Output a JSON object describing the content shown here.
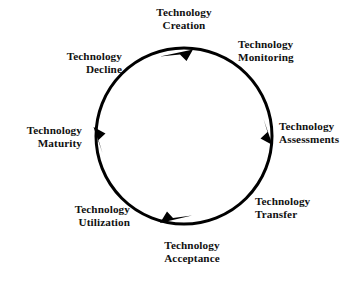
{
  "diagram": {
    "type": "cycle",
    "direction": "clockwise",
    "background_color": "#ffffff",
    "stroke_color": "#000000",
    "text_color": "#111111",
    "circle": {
      "cx": 184,
      "cy": 136,
      "r": 88,
      "stroke_width": 3
    },
    "stages": [
      {
        "id": "creation",
        "line1": "Technology",
        "line2": "Creation",
        "angle_deg": 270,
        "align": "center"
      },
      {
        "id": "monitoring",
        "line1": "Technology",
        "line2": "Monitoring",
        "angle_deg": 315,
        "align": "left"
      },
      {
        "id": "assessments",
        "line1": "Technology",
        "line2": "Assessments",
        "angle_deg": 0,
        "align": "left"
      },
      {
        "id": "transfer",
        "line1": "Technology",
        "line2": "Transfer",
        "angle_deg": 45,
        "align": "left"
      },
      {
        "id": "acceptance",
        "line1": "Technology",
        "line2": "Acceptance",
        "angle_deg": 90,
        "align": "center"
      },
      {
        "id": "utilization",
        "line1": "Technology",
        "line2": "Utilization",
        "angle_deg": 135,
        "align": "right"
      },
      {
        "id": "maturity",
        "line1": "Technology",
        "line2": "Maturity",
        "angle_deg": 180,
        "align": "right"
      },
      {
        "id": "decline",
        "line1": "Technology",
        "line2": "Decline",
        "angle_deg": 225,
        "align": "right"
      }
    ],
    "arrowheads": [
      {
        "id": "top",
        "position": "top",
        "points_toward": "right"
      },
      {
        "id": "right",
        "position": "right",
        "points_toward": "down"
      },
      {
        "id": "bottom",
        "position": "bottom",
        "points_toward": "left"
      },
      {
        "id": "left",
        "position": "left",
        "points_toward": "up"
      }
    ]
  }
}
